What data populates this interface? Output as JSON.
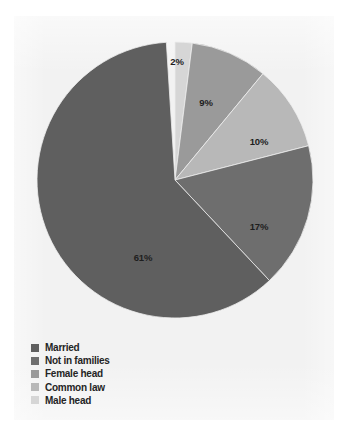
{
  "figure": {
    "background_color": "#ffffff",
    "panel_color": "#f2f2f2",
    "panel_bounds": {
      "x": 14,
      "y": 16,
      "width": 320,
      "height": 404
    }
  },
  "pie": {
    "center_x": 175,
    "center_y": 180,
    "radius": 138,
    "start_angle_deg": 0,
    "direction": "clockwise"
  },
  "legend": {
    "position": "bottom-left",
    "items": [
      {
        "label": "Married",
        "color": "#5f5f5f",
        "swatch_name": "legend-swatch-married"
      },
      {
        "label": "Not in families",
        "color": "#6e6e6e",
        "swatch_name": "legend-swatch-not-in-families"
      },
      {
        "label": "Female head",
        "color": "#9a9a9a",
        "swatch_name": "legend-swatch-female-head"
      },
      {
        "label": "Common law",
        "color": "#b8b8b8",
        "swatch_name": "legend-swatch-common-law"
      },
      {
        "label": "Male head",
        "color": "#d6d6d6",
        "swatch_name": "legend-swatch-male-head"
      }
    ]
  },
  "chart_data": {
    "type": "pie",
    "title": "",
    "subtitle": "",
    "xlabel": "",
    "ylabel": "",
    "grid": false,
    "legend_position": "bottom-left",
    "units": "percent",
    "total": 99,
    "slice_order_clockwise_from_top": [
      "Male head",
      "Female head",
      "Common law",
      "Not in families",
      "Married"
    ],
    "categories": [
      "Married",
      "Not in families",
      "Female head",
      "Common law",
      "Male head"
    ],
    "values": [
      61,
      17,
      9,
      10,
      2
    ],
    "labels": [
      "61%",
      "17%",
      "9%",
      "10%",
      "2%"
    ],
    "colors": [
      "#5f5f5f",
      "#6e6e6e",
      "#9a9a9a",
      "#b8b8b8",
      "#d6d6d6"
    ],
    "slices": [
      {
        "name": "Male head",
        "value": 2,
        "label": "2%",
        "color": "#d6d6d6",
        "start_angle_deg": 0,
        "end_angle_deg": 7.2,
        "label_x": 177,
        "label_y": 62
      },
      {
        "name": "Female head",
        "value": 9,
        "label": "9%",
        "color": "#9a9a9a",
        "start_angle_deg": 7.2,
        "end_angle_deg": 39.6,
        "label_x": 206,
        "label_y": 103
      },
      {
        "name": "Common law",
        "value": 10,
        "label": "10%",
        "color": "#b8b8b8",
        "start_angle_deg": 39.6,
        "end_angle_deg": 75.6,
        "label_x": 259,
        "label_y": 142
      },
      {
        "name": "Not in families",
        "value": 17,
        "label": "17%",
        "color": "#6e6e6e",
        "start_angle_deg": 75.6,
        "end_angle_deg": 136.8,
        "label_x": 259,
        "label_y": 227
      },
      {
        "name": "Married",
        "value": 61,
        "label": "61%",
        "color": "#5f5f5f",
        "start_angle_deg": 136.8,
        "end_angle_deg": 356.4,
        "label_x": 143,
        "label_y": 258
      }
    ]
  }
}
